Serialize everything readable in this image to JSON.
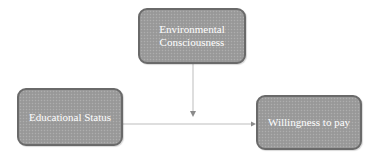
{
  "diagram": {
    "type": "moderation-model",
    "nodes": [
      {
        "id": "env",
        "label": "Environmental\nConsciousness",
        "role": "moderator"
      },
      {
        "id": "edu",
        "label": "Educational Status",
        "role": "independent"
      },
      {
        "id": "wtp",
        "label": "Willingness to pay",
        "role": "dependent"
      }
    ],
    "edges": [
      {
        "from": "edu",
        "to": "wtp",
        "style": "line-with-arrow"
      },
      {
        "from": "env",
        "to": "edu-wtp-edge",
        "style": "line-with-arrow"
      }
    ],
    "colors": {
      "node_fill": "#9c9c9c",
      "node_border": "#6a6a6a",
      "node_text": "#ffffff",
      "edge": "#b8b8b8",
      "arrowhead": "#8a8a8a"
    }
  }
}
